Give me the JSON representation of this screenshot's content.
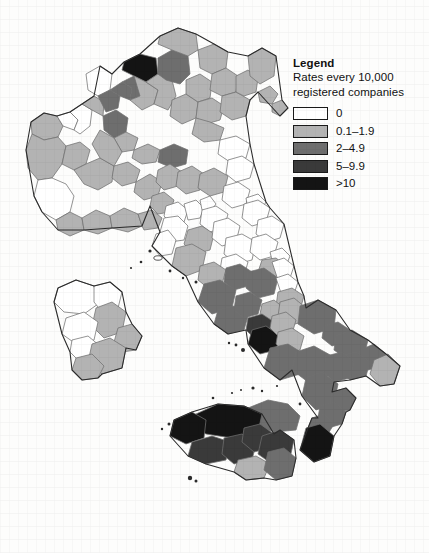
{
  "figure": {
    "type": "choropleth-map",
    "region": "Italy",
    "unit": "province"
  },
  "legend": {
    "title": "Legend",
    "subtitle": "Rates every 10,000\nregistered companies",
    "classes": [
      {
        "label": "0",
        "color": "#ffffff",
        "min": 0,
        "max": 0
      },
      {
        "label": "0.1–1.9",
        "color": "#b3b3b3",
        "min": 0.1,
        "max": 1.9
      },
      {
        "label": "2–4.9",
        "color": "#6e6e6e",
        "min": 2,
        "max": 4.9
      },
      {
        "label": "5–9.9",
        "color": "#3a3a3a",
        "min": 5,
        "max": 9.9
      },
      {
        "label": ">10",
        "color": "#141414",
        "min": 10,
        "max": null
      }
    ]
  },
  "chart_data": {
    "type": "heatmap",
    "title": "",
    "xlabel": "",
    "ylabel": "",
    "legend_position": "top-right",
    "grid": false,
    "categories": [
      "0",
      "0.1–1.9",
      "2–4.9",
      "5–9.9",
      ">10"
    ],
    "values": [
      0,
      1,
      2,
      3,
      4
    ],
    "colors": [
      "#ffffff",
      "#b3b3b3",
      "#6e6e6e",
      "#3a3a3a",
      "#141414"
    ]
  },
  "map": {
    "outline_color": "#2b2b2b",
    "border_color": "#707070",
    "background": "#fdfdfc",
    "provinces": [
      {
        "name": "valle-d-aosta",
        "cls": 1,
        "d": "M31,122 L44,113 L57,116 L63,126 L58,137 L44,140 L32,134 Z"
      },
      {
        "name": "torino",
        "cls": 1,
        "d": "M32,134 L44,140 L58,137 L66,146 L62,164 L52,178 L38,180 L28,168 L26,150 Z"
      },
      {
        "name": "biella",
        "cls": 0,
        "d": "M57,116 L70,112 L78,120 L74,130 L63,126 Z"
      },
      {
        "name": "vercelli",
        "cls": 0,
        "d": "M70,112 L82,104 L92,110 L90,126 L80,134 L74,130 L78,120 Z"
      },
      {
        "name": "novara",
        "cls": 1,
        "d": "M82,104 L94,96 L104,102 L103,116 L92,110 Z"
      },
      {
        "name": "vco",
        "cls": 0,
        "d": "M86,74 L100,66 L112,74 L110,90 L98,96 L88,90 Z"
      },
      {
        "name": "cuneo",
        "cls": 0,
        "d": "M38,180 L52,178 L66,184 L74,196 L70,212 L56,220 L42,212 L34,196 Z"
      },
      {
        "name": "asti",
        "cls": 1,
        "d": "M66,146 L80,142 L90,150 L86,164 L74,170 L62,164 Z"
      },
      {
        "name": "alessandria",
        "cls": 1,
        "d": "M86,164 L100,158 L114,166 L112,182 L98,190 L84,184 L74,170 Z"
      },
      {
        "name": "imperia",
        "cls": 1,
        "d": "M56,220 L70,212 L82,218 L84,230 L70,236 L58,230 Z"
      },
      {
        "name": "savona",
        "cls": 1,
        "d": "M82,218 L96,210 L110,216 L112,228 L98,234 L84,230 Z"
      },
      {
        "name": "genova",
        "cls": 1,
        "d": "M110,216 L124,208 L138,214 L142,226 L128,232 L112,228 Z"
      },
      {
        "name": "la-spezia",
        "cls": 1,
        "d": "M138,214 L152,210 L162,218 L158,228 L144,230 L142,226 Z"
      },
      {
        "name": "milano",
        "cls": 2,
        "d": "M103,116 L116,110 L128,118 L126,132 L114,138 L104,130 Z"
      },
      {
        "name": "varese",
        "cls": 2,
        "d": "M98,96 L110,90 L120,96 L118,108 L106,112 Z"
      },
      {
        "name": "como",
        "cls": 2,
        "d": "M110,90 L122,82 L132,88 L130,100 L120,96 Z"
      },
      {
        "name": "lecco",
        "cls": 2,
        "d": "M122,82 L134,76 L142,84 L140,96 L130,100 L132,88 Z"
      },
      {
        "name": "sondrio",
        "cls": 4,
        "d": "M124,62 L140,54 L156,58 L158,74 L146,82 L134,76 L122,70 Z"
      },
      {
        "name": "bergamo",
        "cls": 1,
        "d": "M134,76 L146,82 L158,90 L154,104 L142,110 L130,100 L140,96 Z"
      },
      {
        "name": "brescia",
        "cls": 1,
        "d": "M146,82 L158,74 L172,80 L176,96 L168,110 L154,104 L158,90 Z"
      },
      {
        "name": "lodi",
        "cls": 1,
        "d": "M114,138 L126,132 L138,138 L134,150 L122,152 Z"
      },
      {
        "name": "pavia",
        "cls": 1,
        "d": "M100,130 L114,138 L122,152 L114,166 L100,158 L92,144 Z"
      },
      {
        "name": "cremona",
        "cls": 1,
        "d": "M134,150 L148,144 L160,150 L156,162 L142,164 L132,158 Z"
      },
      {
        "name": "mantova",
        "cls": 2,
        "d": "M160,150 L174,144 L188,150 L186,164 L172,168 L158,162 Z"
      },
      {
        "name": "trento",
        "cls": 2,
        "d": "M158,58 L172,50 L188,56 L190,74 L180,84 L166,80 L158,74 Z"
      },
      {
        "name": "bolzano",
        "cls": 1,
        "d": "M160,36 L178,28 L196,34 L198,50 L188,56 L172,50 L158,44 Z"
      },
      {
        "name": "verona",
        "cls": 1,
        "d": "M172,100 L186,94 L198,102 L196,118 L182,124 L170,116 Z"
      },
      {
        "name": "vicenza",
        "cls": 1,
        "d": "M186,80 L200,74 L212,82 L210,98 L198,102 L186,94 Z"
      },
      {
        "name": "belluno",
        "cls": 1,
        "d": "M198,50 L214,44 L228,52 L226,68 L212,74 L200,68 Z"
      },
      {
        "name": "treviso",
        "cls": 1,
        "d": "M212,74 L226,68 L238,76 L236,92 L222,96 L210,90 Z"
      },
      {
        "name": "padova",
        "cls": 1,
        "d": "M198,102 L212,98 L224,106 L220,120 L206,124 L196,118 Z"
      },
      {
        "name": "venezia",
        "cls": 1,
        "d": "M222,96 L236,92 L250,100 L246,116 L232,120 L220,112 Z"
      },
      {
        "name": "rovigo",
        "cls": 1,
        "d": "M196,118 L210,122 L224,128 L220,140 L204,142 L192,134 Z"
      },
      {
        "name": "pordenone",
        "cls": 1,
        "d": "M236,76 L248,70 L258,78 L256,92 L244,96 L236,92 Z"
      },
      {
        "name": "udine",
        "cls": 1,
        "d": "M248,56 L262,48 L276,56 L274,76 L260,84 L250,76 Z"
      },
      {
        "name": "gorizia",
        "cls": 1,
        "d": "M258,92 L270,86 L278,94 L272,104 L260,102 Z"
      },
      {
        "name": "trieste",
        "cls": 1,
        "d": "M272,104 L282,100 L288,108 L280,116 L272,112 Z"
      },
      {
        "name": "piacenza",
        "cls": 1,
        "d": "M114,166 L128,162 L140,170 L136,182 L122,186 L112,178 Z"
      },
      {
        "name": "parma",
        "cls": 1,
        "d": "M136,182 L150,174 L162,182 L158,196 L144,200 L134,192 Z"
      },
      {
        "name": "reggio-emilia",
        "cls": 1,
        "d": "M158,170 L170,164 L182,172 L178,186 L164,190 L156,182 Z"
      },
      {
        "name": "modena",
        "cls": 1,
        "d": "M178,172 L192,166 L204,174 L200,190 L186,194 L176,186 Z"
      },
      {
        "name": "bologna",
        "cls": 1,
        "d": "M200,174 L214,168 L228,176 L224,192 L210,196 L198,188 Z"
      },
      {
        "name": "ferrara",
        "cls": 0,
        "d": "M220,140 L236,136 L250,144 L246,158 L230,162 L218,154 Z"
      },
      {
        "name": "ravenna",
        "cls": 0,
        "d": "M228,160 L242,156 L254,164 L250,178 L236,182 L226,174 Z"
      },
      {
        "name": "forli-cesena",
        "cls": 0,
        "d": "M224,186 L238,182 L250,190 L246,204 L232,208 L222,200 Z"
      },
      {
        "name": "rimini",
        "cls": 0,
        "d": "M246,198 L258,194 L266,202 L260,212 L248,210 Z"
      },
      {
        "name": "massa-carrara",
        "cls": 1,
        "d": "M152,196 L164,192 L174,200 L170,212 L158,214 L150,206 Z"
      },
      {
        "name": "lucca",
        "cls": 0,
        "d": "M166,206 L178,202 L188,210 L184,222 L172,224 L164,216 Z"
      },
      {
        "name": "pistoia",
        "cls": 0,
        "d": "M184,204 L196,200 L204,208 L200,218 L188,220 Z"
      },
      {
        "name": "prato",
        "cls": 0,
        "d": "M200,200 L210,196 L216,204 L210,212 L202,210 Z"
      },
      {
        "name": "firenze",
        "cls": 0,
        "d": "M202,210 L216,206 L228,214 L224,228 L210,232 L200,224 Z"
      },
      {
        "name": "pisa",
        "cls": 0,
        "d": "M164,218 L178,216 L188,226 L184,240 L170,242 L160,232 Z"
      },
      {
        "name": "livorno",
        "cls": 0,
        "d": "M156,234 L168,230 L176,240 L172,254 L160,256 L152,246 Z"
      },
      {
        "name": "siena",
        "cls": 1,
        "d": "M188,230 L202,226 L214,234 L210,250 L194,254 L184,244 Z"
      },
      {
        "name": "arezzo",
        "cls": 0,
        "d": "M214,222 L228,218 L240,226 L236,242 L222,246 L212,238 Z"
      },
      {
        "name": "grosseto",
        "cls": 1,
        "d": "M176,248 L192,244 L206,252 L202,270 L186,276 L172,266 Z"
      },
      {
        "name": "perugia",
        "cls": 0,
        "d": "M226,238 L242,234 L256,242 L252,260 L236,264 L224,254 Z"
      },
      {
        "name": "terni",
        "cls": 0,
        "d": "M222,258 L236,254 L248,262 L244,276 L230,280 L220,270 Z"
      },
      {
        "name": "pesaro-urbino",
        "cls": 0,
        "d": "M244,204 L258,200 L270,208 L266,222 L252,226 L242,218 Z"
      },
      {
        "name": "ancona",
        "cls": 0,
        "d": "M258,220 L272,216 L284,224 L280,238 L266,242 L256,234 Z"
      },
      {
        "name": "macerata",
        "cls": 0,
        "d": "M252,238 L266,234 L278,242 L274,256 L260,260 L250,252 Z"
      },
      {
        "name": "fermo",
        "cls": 0,
        "d": "M270,252 L282,248 L290,256 L286,266 L274,268 Z"
      },
      {
        "name": "ascoli-piceno",
        "cls": 1,
        "d": "M262,260 L276,258 L286,266 L282,278 L268,280 L258,272 Z"
      },
      {
        "name": "viterbo",
        "cls": 1,
        "d": "M200,266 L214,262 L226,270 L222,284 L208,288 L198,280 Z"
      },
      {
        "name": "rieti",
        "cls": 2,
        "d": "M226,268 L240,264 L252,272 L248,286 L234,290 L224,282 Z"
      },
      {
        "name": "roma",
        "cls": 2,
        "d": "M204,284 L220,280 L236,290 L232,308 L212,314 L198,302 Z"
      },
      {
        "name": "latina",
        "cls": 2,
        "d": "M218,310 L234,306 L248,316 L244,330 L228,334 L214,324 Z"
      },
      {
        "name": "frosinone",
        "cls": 2,
        "d": "M236,296 L250,292 L262,300 L258,314 L244,318 L234,310 Z"
      },
      {
        "name": "l-aquila",
        "cls": 2,
        "d": "M248,272 L264,268 L278,278 L274,294 L258,298 L246,288 Z"
      },
      {
        "name": "teramo",
        "cls": 0,
        "d": "M272,262 L284,258 L294,266 L290,278 L278,280 Z"
      },
      {
        "name": "pescara",
        "cls": 0,
        "d": "M276,278 L288,274 L298,282 L294,294 L282,296 Z"
      },
      {
        "name": "chieti",
        "cls": 1,
        "d": "M278,292 L292,288 L304,296 L300,310 L286,314 L276,306 Z"
      },
      {
        "name": "isernia",
        "cls": 1,
        "d": "M262,304 L274,300 L284,308 L280,320 L268,322 L260,314 Z"
      },
      {
        "name": "campobasso",
        "cls": 1,
        "d": "M280,302 L294,298 L306,308 L302,322 L288,326 L278,316 Z"
      },
      {
        "name": "caserta",
        "cls": 3,
        "d": "M248,318 L262,314 L274,322 L270,336 L256,340 L246,330 Z"
      },
      {
        "name": "napoli",
        "cls": 4,
        "d": "M252,330 L266,326 L280,336 L276,350 L260,354 L248,344 Z"
      },
      {
        "name": "benevento",
        "cls": 1,
        "d": "M272,316 L286,312 L296,320 L292,334 L278,336 L270,328 Z"
      },
      {
        "name": "avellino",
        "cls": 1,
        "d": "M278,332 L292,328 L304,336 L300,350 L286,354 L276,344 Z"
      },
      {
        "name": "salerno",
        "cls": 2,
        "d": "M270,348 L288,344 L304,354 L300,374 L280,380 L264,368 Z"
      },
      {
        "name": "foggia",
        "cls": 2,
        "d": "M300,306 L318,300 L336,310 L334,328 L314,334 L298,324 Z"
      },
      {
        "name": "bat",
        "cls": 2,
        "d": "M324,326 L338,322 L350,330 L346,342 L332,346 L322,338 Z"
      },
      {
        "name": "bari",
        "cls": 2,
        "d": "M336,336 L352,330 L368,340 L364,356 L348,360 L334,350 Z"
      },
      {
        "name": "brindisi",
        "cls": 2,
        "d": "M360,350 L374,344 L386,354 L382,366 L368,370 L358,362 Z"
      },
      {
        "name": "lecce",
        "cls": 1,
        "d": "M374,360 L388,354 L400,366 L394,384 L380,386 L370,374 Z"
      },
      {
        "name": "taranto",
        "cls": 2,
        "d": "M340,356 L356,352 L370,362 L366,376 L350,380 L338,370 Z"
      },
      {
        "name": "potenza",
        "cls": 2,
        "d": "M296,352 L314,346 L332,356 L328,376 L308,382 L292,370 Z"
      },
      {
        "name": "matera",
        "cls": 2,
        "d": "M326,356 L342,352 L354,362 L350,378 L334,382 L324,372 Z"
      },
      {
        "name": "cosenza",
        "cls": 2,
        "d": "M306,378 L322,372 L338,384 L334,404 L316,410 L302,396 Z"
      },
      {
        "name": "crotone",
        "cls": 2,
        "d": "M332,392 L346,388 L356,398 L350,410 L336,412 L330,402 Z"
      },
      {
        "name": "catanzaro",
        "cls": 2,
        "d": "M320,406 L334,402 L346,412 L342,424 L328,428 L318,418 Z"
      },
      {
        "name": "vibo-valentia",
        "cls": 2,
        "d": "M312,418 L324,414 L334,424 L328,434 L316,436 L308,428 Z"
      },
      {
        "name": "reggio-calabria",
        "cls": 4,
        "d": "M306,428 L320,424 L334,436 L330,456 L314,462 L300,450 Z"
      },
      {
        "name": "messina",
        "cls": 2,
        "d": "M248,408 L268,400 L288,404 L300,416 L296,430 L274,432 L252,424 Z"
      },
      {
        "name": "palermo",
        "cls": 4,
        "d": "M196,414 L218,404 L244,406 L262,414 L258,432 L232,438 L206,434 L190,426 Z"
      },
      {
        "name": "trapani",
        "cls": 4,
        "d": "M174,420 L192,412 L206,420 L204,438 L186,444 L170,436 Z"
      },
      {
        "name": "agrigento",
        "cls": 3,
        "d": "M192,442 L212,436 L230,442 L226,460 L206,464 L188,456 Z"
      },
      {
        "name": "caltanissetta",
        "cls": 3,
        "d": "M224,438 L242,434 L256,444 L252,460 L234,464 L222,454 Z"
      },
      {
        "name": "enna",
        "cls": 3,
        "d": "M244,428 L260,424 L274,434 L270,448 L254,452 L242,442 Z"
      },
      {
        "name": "catania",
        "cls": 3,
        "d": "M262,436 L280,430 L294,440 L290,458 L272,464 L258,454 Z"
      },
      {
        "name": "ragusa",
        "cls": 1,
        "d": "M238,460 L256,456 L270,464 L264,478 L246,480 L234,472 Z"
      },
      {
        "name": "siracusa",
        "cls": 2,
        "d": "M268,452 L284,448 L296,458 L292,476 L276,480 L264,470 Z"
      },
      {
        "name": "sassari",
        "cls": 0,
        "d": "M58,288 L76,280 L94,286 L98,304 L84,314 L64,312 L54,302 Z"
      },
      {
        "name": "olbia-tempio",
        "cls": 0,
        "d": "M94,286 L110,282 L122,292 L118,308 L102,312 L94,302 Z"
      },
      {
        "name": "nuoro",
        "cls": 1,
        "d": "M96,308 L112,302 L126,312 L122,332 L104,338 L92,326 Z"
      },
      {
        "name": "ogliastra",
        "cls": 1,
        "d": "M118,328 L132,324 L142,336 L136,350 L122,352 L114,342 Z"
      },
      {
        "name": "oristano",
        "cls": 0,
        "d": "M66,318 L84,312 L98,322 L94,340 L76,344 L62,334 Z"
      },
      {
        "name": "medio-campidano",
        "cls": 0,
        "d": "M72,340 L88,336 L100,346 L96,360 L80,362 L70,352 Z"
      },
      {
        "name": "cagliari",
        "cls": 1,
        "d": "M92,344 L110,338 L126,348 L122,368 L102,374 L88,362 Z"
      },
      {
        "name": "carbonia-iglesias",
        "cls": 1,
        "d": "M76,358 L92,354 L104,366 L98,378 L82,380 L72,370 Z"
      }
    ]
  }
}
